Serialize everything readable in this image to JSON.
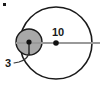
{
  "figure": {
    "type": "geometry-diagram",
    "background_color": "#ffffff"
  },
  "labels": {
    "large_circle_radius": "10",
    "small_circle_radius": "3"
  },
  "colors": {
    "outline": "#1a1a1a",
    "small_circle_fill": "#a8a8a8",
    "radius_line": "#999999",
    "center_dot": "#111111",
    "leader_line": "#333333",
    "text": "#1a1a1a"
  },
  "geometry": {
    "large_circle": {
      "cx": 56,
      "cy": 43,
      "r": 36,
      "stroke_width": 1.6,
      "fill": "none"
    },
    "small_circle": {
      "cx": 29,
      "cy": 42,
      "r": 13,
      "stroke_width": 1.4
    },
    "radius_line": {
      "x1": 16,
      "y1": 43,
      "x2": 100,
      "y2": 43,
      "stroke_width": 2.2
    },
    "small_radius_tick": {
      "x1": 29,
      "y1": 42,
      "x2": 29,
      "y2": 55,
      "stroke_width": 1.3
    },
    "large_center_dot": {
      "cx": 56,
      "cy": 43,
      "r": 2.8
    },
    "small_center_dot": {
      "cx": 29,
      "cy": 42,
      "r": 2.6
    },
    "leader_line_path": "M 14 63 L 19 62 Q 27 60 29 53",
    "corner_artifact": {
      "x": 3,
      "y": 3,
      "w": 3,
      "h": 3
    },
    "label_10_pos": {
      "x": 58,
      "y": 36
    },
    "label_3_pos": {
      "x": 5,
      "y": 67
    }
  }
}
